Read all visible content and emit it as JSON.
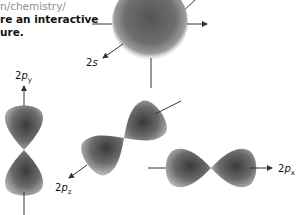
{
  "caption": {
    "url_fragment": "n/chemistry/",
    "line1": "re an interactive",
    "line2": "ure."
  },
  "orbitals": [
    {
      "id": "2s",
      "label_main": "2",
      "label_letter": "s",
      "label_sub": "",
      "shape": "sphere"
    },
    {
      "id": "2py",
      "label_main": "2",
      "label_letter": "p",
      "label_sub": "y",
      "shape": "dumbbell-vertical"
    },
    {
      "id": "2pz",
      "label_main": "2",
      "label_letter": "p",
      "label_sub": "z",
      "shape": "dumbbell-diagonal"
    },
    {
      "id": "2px",
      "label_main": "2",
      "label_letter": "p",
      "label_sub": "x",
      "shape": "dumbbell-horizontal"
    }
  ],
  "colors": {
    "orbital_dark": "#3a3a3a",
    "orbital_mid": "#7a7a7a",
    "orbital_light": "#c4c4c4",
    "axis": "#333333"
  }
}
